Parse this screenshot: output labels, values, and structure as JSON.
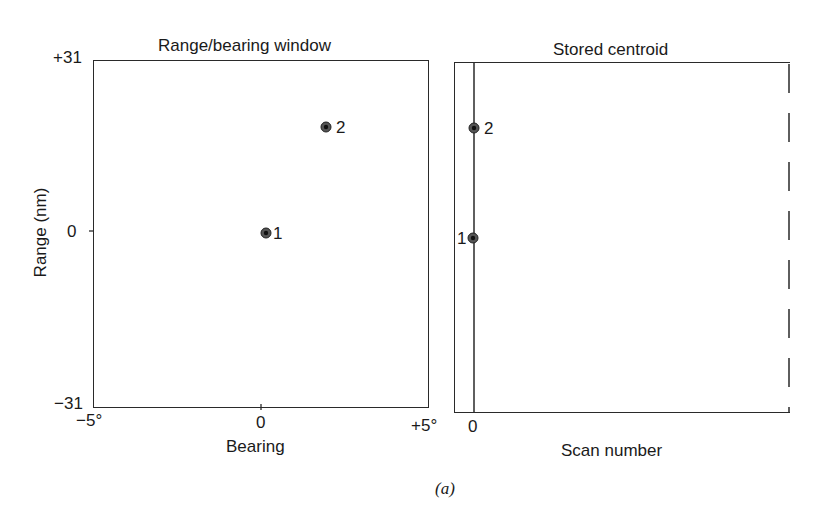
{
  "figure": {
    "caption": "(a)"
  },
  "left_panel": {
    "title": "Range/bearing window",
    "ylabel": "Range (nm)",
    "xlabel": "Bearing",
    "y_ticks": [
      "+31",
      "0",
      "−31"
    ],
    "x_ticks": [
      "−5°",
      "0",
      "+5°"
    ],
    "points": [
      {
        "label": "1",
        "bearing": 0.1,
        "range": 0
      },
      {
        "label": "2",
        "bearing": 2.0,
        "range": 19
      }
    ]
  },
  "right_panel": {
    "title": "Stored centroid",
    "xlabel": "Scan number",
    "x_ticks": [
      "0"
    ],
    "points": [
      {
        "label": "2",
        "scan": 0
      },
      {
        "label": "1",
        "scan": 0
      }
    ]
  },
  "colors": {
    "line": "#2a2a2a",
    "point": "#333333",
    "background": "#ffffff"
  }
}
